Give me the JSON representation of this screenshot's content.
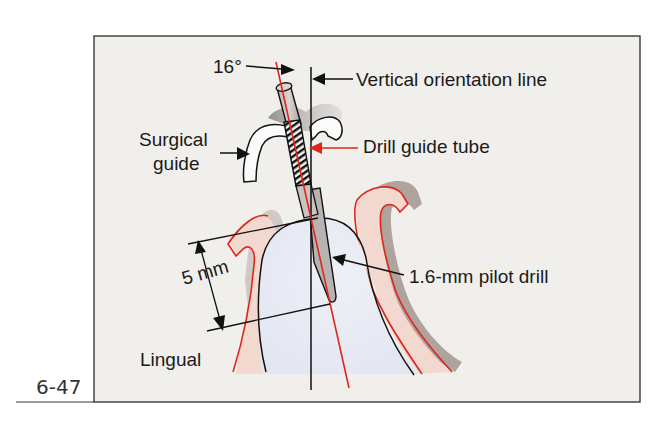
{
  "figure": {
    "number": "6-47",
    "colors": {
      "panel_bg": "#f1efec",
      "frame": "#3a3a3a",
      "red": "#e0261b",
      "gum_fill": "#f3d8cf",
      "gum_shadow": "#a39590",
      "bone_fill": "#e8ebf4",
      "ink": "#111111"
    },
    "labels": {
      "angle": "16°",
      "vertical_line": "Vertical orientation line",
      "surgical_guide_line1": "Surgical",
      "surgical_guide_line2": "guide",
      "drill_guide_tube": "Drill guide tube",
      "depth": "5 mm",
      "pilot_drill": "1.6-mm pilot drill",
      "side": "Lingual"
    },
    "measurements": {
      "angle_degrees": 16,
      "depth_mm": 5,
      "drill_diameter_mm": 1.6
    }
  }
}
